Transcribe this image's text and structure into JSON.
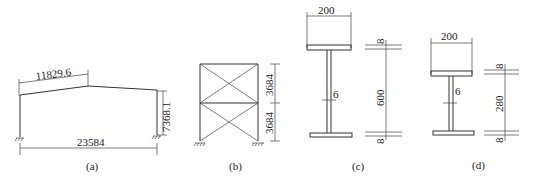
{
  "figures": {
    "a": {
      "caption": "(a)",
      "title": "portal frame",
      "dims": {
        "rafter_length": "11829.6",
        "column_height": "7368.1",
        "span": "23584"
      }
    },
    "b": {
      "caption": "(b)",
      "title": "braced frame",
      "dims": {
        "upper_story": "3684",
        "lower_story": "3684"
      }
    },
    "c": {
      "caption": "(c)",
      "title": "I-section",
      "dims": {
        "flange_width": "200",
        "web_thickness": "6",
        "web_height": "600",
        "top_flange": "8",
        "bottom_flange": "8"
      }
    },
    "d": {
      "caption": "(d)",
      "title": "I-section",
      "dims": {
        "flange_width": "200",
        "web_thickness": "6",
        "web_height": "280",
        "top_flange": "8",
        "bottom_flange": "8"
      }
    }
  }
}
